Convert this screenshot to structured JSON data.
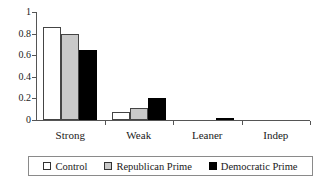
{
  "chart_data": {
    "type": "bar",
    "title": "",
    "xlabel": "",
    "ylabel": "",
    "categories": [
      "Strong",
      "Weak",
      "Leaner",
      "Indep"
    ],
    "series": [
      {
        "name": "Control",
        "color": "#ffffff",
        "values": [
          0.86,
          0.075,
          0.0,
          0.0
        ]
      },
      {
        "name": "Republican Prime",
        "color": "#c9c9c9",
        "values": [
          0.8,
          0.11,
          0.0,
          0.0
        ]
      },
      {
        "name": "Democratic Prime",
        "color": "#000000",
        "values": [
          0.645,
          0.2,
          0.012,
          0.0
        ]
      }
    ],
    "ylim": [
      0,
      1
    ],
    "yticks": [
      "0",
      "0.2",
      "0.4",
      "0.6",
      "0.8",
      "1"
    ],
    "ytick_values": [
      0,
      0.2,
      0.4,
      0.6,
      0.8,
      1
    ],
    "grid": false,
    "legend_position": "bottom"
  },
  "axis": {
    "y_labels": [
      "1",
      "0.8",
      "0.6",
      "0.4",
      "0.2",
      "0"
    ]
  },
  "legend": {
    "entries": [
      {
        "label": "Control",
        "swatch": "white-square-swatch"
      },
      {
        "label": "Republican Prime",
        "swatch": "gray-square-swatch"
      },
      {
        "label": "Democratic Prime",
        "swatch": "black-square-swatch"
      }
    ]
  }
}
